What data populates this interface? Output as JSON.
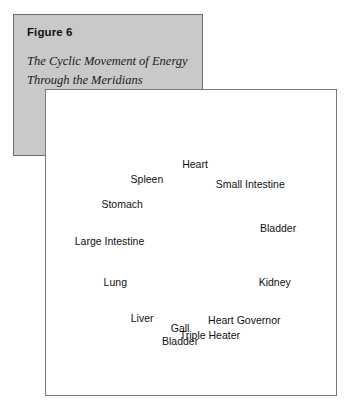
{
  "caption": {
    "figure_label": "Figure 6",
    "title_line_1": "The Cyclic Movement of Energy",
    "title_line_2": "Through the Meridians"
  },
  "colors": {
    "caption_background": "#c9c9c9",
    "caption_border": "#6d6d6d",
    "diagram_background": "#ffffff",
    "diagram_border": "#7a7a7a",
    "ink": "#111111"
  },
  "diagram": {
    "type": "cycle",
    "direction": "clockwise",
    "node_count": 12,
    "nodes": [
      {
        "label": "Heart",
        "lines": [
          "Heart"
        ],
        "angle_deg": 270,
        "anchor": "middle"
      },
      {
        "label": "Small Intestine",
        "lines": [
          "Small Intestine"
        ],
        "angle_deg": 310,
        "anchor": "middle"
      },
      {
        "label": "Bladder",
        "lines": [
          "Bladder"
        ],
        "angle_deg": 345,
        "anchor": "middle"
      },
      {
        "label": "Kidney",
        "lines": [
          "Kidney"
        ],
        "angle_deg": 22,
        "anchor": "middle"
      },
      {
        "label": "Heart Governor",
        "lines": [
          "Heart Governor"
        ],
        "angle_deg": 55,
        "anchor": "middle"
      },
      {
        "label": "Triple Heater",
        "lines": [
          "Triple Heater"
        ],
        "angle_deg": 80,
        "anchor": "middle"
      },
      {
        "label": "Gall Bladder",
        "lines": [
          "Gall",
          "Bladder"
        ],
        "angle_deg": 100,
        "anchor": "middle"
      },
      {
        "label": "Liver",
        "lines": [
          "Liver"
        ],
        "angle_deg": 128,
        "anchor": "middle"
      },
      {
        "label": "Lung",
        "lines": [
          "Lung"
        ],
        "angle_deg": 158,
        "anchor": "middle"
      },
      {
        "label": "Large Intestine",
        "lines": [
          "Large Intestine"
        ],
        "angle_deg": 186,
        "anchor": "middle"
      },
      {
        "label": "Stomach",
        "lines": [
          "Stomach"
        ],
        "angle_deg": 212,
        "anchor": "middle"
      },
      {
        "label": "Spleen",
        "lines": [
          "Spleen"
        ],
        "angle_deg": 236,
        "anchor": "middle"
      }
    ],
    "edges": [
      {
        "from": "Spleen",
        "to": "Heart"
      },
      {
        "from": "Heart",
        "to": "Small Intestine"
      },
      {
        "from": "Small Intestine",
        "to": "Bladder"
      },
      {
        "from": "Bladder",
        "to": "Kidney"
      },
      {
        "from": "Kidney",
        "to": "Heart Governor"
      },
      {
        "from": "Heart Governor",
        "to": "Triple Heater"
      },
      {
        "from": "Triple Heater",
        "to": "Gall Bladder"
      },
      {
        "from": "Gall Bladder",
        "to": "Liver"
      },
      {
        "from": "Liver",
        "to": "Lung"
      },
      {
        "from": "Lung",
        "to": "Large Intestine"
      },
      {
        "from": "Large Intestine",
        "to": "Stomach"
      },
      {
        "from": "Stomach",
        "to": "Spleen"
      }
    ]
  }
}
